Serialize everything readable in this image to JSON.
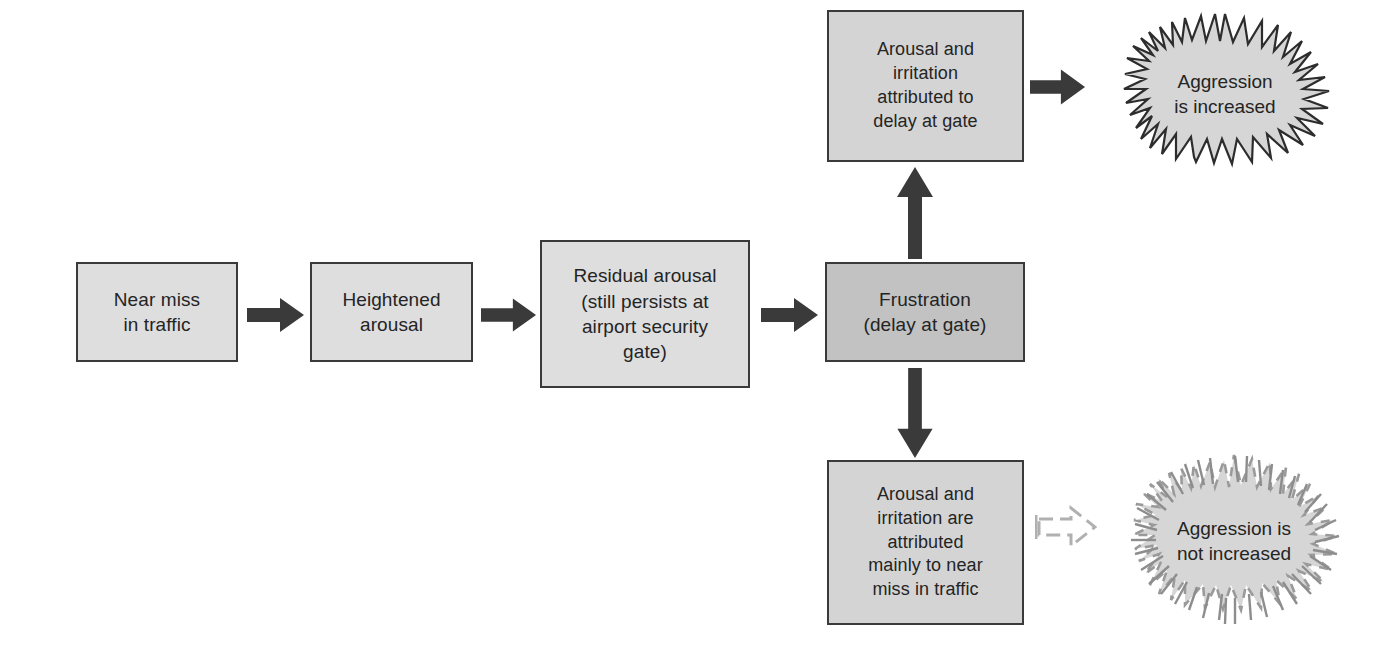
{
  "diagram": {
    "colors": {
      "box_fill_light": "#dedede",
      "box_fill_mid": "#d4d4d4",
      "box_fill_dark": "#c2c2c2",
      "box_border": "#3a3a3a",
      "arrow_solid": "#3a3a3a",
      "arrow_faded": "#b3b3b3",
      "burst_fill": "#d6d6d6",
      "burst_stroke": "#2d2d2d",
      "burst_stroke_faded": "#8d8d8d",
      "text": "#242424",
      "background": "#ffffff"
    },
    "nodes": [
      {
        "id": "near-miss",
        "label": "Near miss\nin traffic"
      },
      {
        "id": "heightened-arousal",
        "label": "Heightened\narousal"
      },
      {
        "id": "residual-arousal",
        "label": "Residual arousal\n(still persists at\nairport security\ngate)"
      },
      {
        "id": "frustration",
        "label": "Frustration\n(delay at gate)"
      },
      {
        "id": "attributed-to-delay",
        "label": "Arousal and\nirritation\nattributed to\ndelay at gate"
      },
      {
        "id": "attributed-to-near-miss",
        "label": "Arousal and\nirritation are\nattributed\nmainly to near\nmiss in traffic"
      }
    ],
    "outcomes": [
      {
        "id": "aggression-increased",
        "label": "Aggression\nis increased",
        "style": "solid"
      },
      {
        "id": "aggression-not-increased",
        "label": "Aggression is\nnot increased",
        "style": "faded"
      }
    ],
    "connectors": [
      {
        "id": "arrow-near-miss-to-heightened",
        "from": "near-miss",
        "to": "heightened-arousal",
        "direction": "right",
        "style": "solid"
      },
      {
        "id": "arrow-heightened-to-residual",
        "from": "heightened-arousal",
        "to": "residual-arousal",
        "direction": "right",
        "style": "solid"
      },
      {
        "id": "arrow-residual-to-frustration",
        "from": "residual-arousal",
        "to": "frustration",
        "direction": "right",
        "style": "solid"
      },
      {
        "id": "arrow-frustration-to-delay-attrib",
        "from": "frustration",
        "to": "attributed-to-delay",
        "direction": "up",
        "style": "solid"
      },
      {
        "id": "arrow-frustration-to-nearmiss-attrib",
        "from": "frustration",
        "to": "attributed-to-near-miss",
        "direction": "down",
        "style": "solid"
      },
      {
        "id": "arrow-delay-attrib-to-aggression",
        "from": "attributed-to-delay",
        "to": "aggression-increased",
        "direction": "right",
        "style": "solid"
      },
      {
        "id": "arrow-nearmiss-attrib-to-no-aggression",
        "from": "attributed-to-near-miss",
        "to": "aggression-not-increased",
        "direction": "right",
        "style": "faded"
      }
    ]
  }
}
